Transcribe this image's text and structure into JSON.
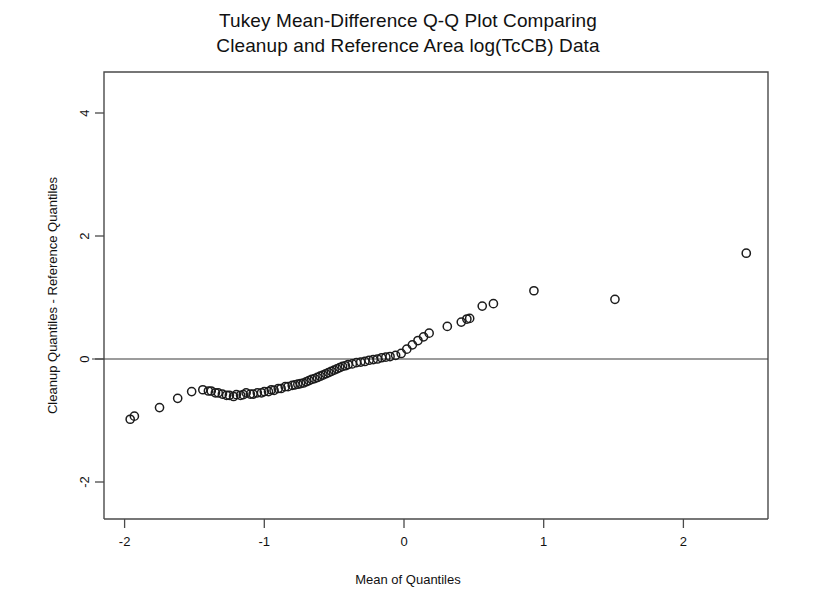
{
  "chart_data": {
    "type": "scatter",
    "title": "Tukey Mean-Difference Q-Q Plot Comparing Cleanup and Reference Area log(TcCB) Data",
    "title_lines": [
      "Tukey Mean-Difference Q-Q Plot Comparing",
      "Cleanup and Reference Area log(TcCB) Data"
    ],
    "xlabel": "Mean of Quantiles",
    "ylabel": "Cleanup Quantiles - Reference Quantiles",
    "xlim": [
      -2.15,
      2.6
    ],
    "ylim": [
      -2.7,
      4.7
    ],
    "xticks": [
      -2,
      -1,
      0,
      1,
      2
    ],
    "xticklabels": [
      "-2",
      "-1",
      "0",
      "1",
      "2"
    ],
    "yticks": [
      -2,
      0,
      2,
      4
    ],
    "yticklabels": [
      "-2",
      "0",
      "2",
      "4"
    ],
    "grid": false,
    "legend": null,
    "marker": "open-circle",
    "marker_color": "#1c1c1c",
    "reference_line": {
      "type": "horizontal",
      "y": 0,
      "color": "#3a3a3a"
    },
    "n_points": 77,
    "x": [
      -1.96,
      -1.93,
      -1.75,
      -1.62,
      -1.52,
      -1.44,
      -1.4,
      -1.38,
      -1.35,
      -1.33,
      -1.3,
      -1.27,
      -1.25,
      -1.22,
      -1.2,
      -1.17,
      -1.15,
      -1.13,
      -1.1,
      -1.08,
      -1.05,
      -1.02,
      -1.0,
      -0.97,
      -0.95,
      -0.93,
      -0.9,
      -0.88,
      -0.85,
      -0.83,
      -0.8,
      -0.78,
      -0.76,
      -0.74,
      -0.72,
      -0.7,
      -0.68,
      -0.66,
      -0.64,
      -0.62,
      -0.6,
      -0.58,
      -0.56,
      -0.54,
      -0.52,
      -0.5,
      -0.48,
      -0.46,
      -0.44,
      -0.42,
      -0.4,
      -0.37,
      -0.34,
      -0.31,
      -0.28,
      -0.25,
      -0.22,
      -0.19,
      -0.16,
      -0.13,
      -0.1,
      -0.06,
      -0.02,
      0.02,
      0.06,
      0.1,
      0.14,
      0.18,
      0.31,
      0.41,
      0.45,
      0.47,
      0.56,
      0.64,
      0.93,
      1.51,
      2.45
    ],
    "y": [
      -0.98,
      -0.93,
      -0.79,
      -0.64,
      -0.53,
      -0.5,
      -0.52,
      -0.52,
      -0.55,
      -0.55,
      -0.57,
      -0.59,
      -0.59,
      -0.61,
      -0.58,
      -0.59,
      -0.58,
      -0.55,
      -0.57,
      -0.57,
      -0.55,
      -0.55,
      -0.53,
      -0.53,
      -0.5,
      -0.51,
      -0.48,
      -0.48,
      -0.45,
      -0.45,
      -0.43,
      -0.42,
      -0.41,
      -0.4,
      -0.39,
      -0.37,
      -0.35,
      -0.33,
      -0.32,
      -0.3,
      -0.28,
      -0.26,
      -0.24,
      -0.22,
      -0.2,
      -0.18,
      -0.16,
      -0.14,
      -0.12,
      -0.11,
      -0.09,
      -0.08,
      -0.06,
      -0.05,
      -0.04,
      -0.02,
      -0.01,
      0.0,
      0.02,
      0.03,
      0.04,
      0.06,
      0.09,
      0.16,
      0.23,
      0.3,
      0.36,
      0.42,
      0.53,
      0.6,
      0.65,
      0.66,
      0.86,
      0.9,
      1.11,
      0.97,
      1.72
    ],
    "points": [
      {
        "x": -1.96,
        "y": -0.98
      },
      {
        "x": -1.93,
        "y": -0.93
      },
      {
        "x": -1.75,
        "y": -0.79
      },
      {
        "x": -1.62,
        "y": -0.64
      },
      {
        "x": -1.52,
        "y": -0.53
      },
      {
        "x": -1.44,
        "y": -0.5
      },
      {
        "x": -1.4,
        "y": -0.52
      },
      {
        "x": -1.38,
        "y": -0.52
      },
      {
        "x": -1.35,
        "y": -0.55
      },
      {
        "x": -1.33,
        "y": -0.55
      },
      {
        "x": -1.3,
        "y": -0.57
      },
      {
        "x": -1.27,
        "y": -0.59
      },
      {
        "x": -1.25,
        "y": -0.59
      },
      {
        "x": -1.22,
        "y": -0.61
      },
      {
        "x": -1.2,
        "y": -0.58
      },
      {
        "x": -1.17,
        "y": -0.59
      },
      {
        "x": -1.15,
        "y": -0.58
      },
      {
        "x": -1.13,
        "y": -0.55
      },
      {
        "x": -1.1,
        "y": -0.57
      },
      {
        "x": -1.08,
        "y": -0.57
      },
      {
        "x": -1.05,
        "y": -0.55
      },
      {
        "x": -1.02,
        "y": -0.55
      },
      {
        "x": -1.0,
        "y": -0.53
      },
      {
        "x": -0.97,
        "y": -0.53
      },
      {
        "x": -0.95,
        "y": -0.5
      },
      {
        "x": -0.93,
        "y": -0.51
      },
      {
        "x": -0.9,
        "y": -0.48
      },
      {
        "x": -0.88,
        "y": -0.48
      },
      {
        "x": -0.85,
        "y": -0.45
      },
      {
        "x": -0.83,
        "y": -0.45
      },
      {
        "x": -0.8,
        "y": -0.43
      },
      {
        "x": -0.78,
        "y": -0.42
      },
      {
        "x": -0.76,
        "y": -0.41
      },
      {
        "x": -0.74,
        "y": -0.4
      },
      {
        "x": -0.72,
        "y": -0.39
      },
      {
        "x": -0.7,
        "y": -0.37
      },
      {
        "x": -0.68,
        "y": -0.35
      },
      {
        "x": -0.66,
        "y": -0.33
      },
      {
        "x": -0.64,
        "y": -0.32
      },
      {
        "x": -0.62,
        "y": -0.3
      },
      {
        "x": -0.6,
        "y": -0.28
      },
      {
        "x": -0.58,
        "y": -0.26
      },
      {
        "x": -0.56,
        "y": -0.24
      },
      {
        "x": -0.54,
        "y": -0.22
      },
      {
        "x": -0.52,
        "y": -0.2
      },
      {
        "x": -0.5,
        "y": -0.18
      },
      {
        "x": -0.48,
        "y": -0.16
      },
      {
        "x": -0.46,
        "y": -0.14
      },
      {
        "x": -0.44,
        "y": -0.12
      },
      {
        "x": -0.42,
        "y": -0.11
      },
      {
        "x": -0.4,
        "y": -0.09
      },
      {
        "x": -0.37,
        "y": -0.08
      },
      {
        "x": -0.34,
        "y": -0.06
      },
      {
        "x": -0.31,
        "y": -0.05
      },
      {
        "x": -0.28,
        "y": -0.04
      },
      {
        "x": -0.25,
        "y": -0.02
      },
      {
        "x": -0.22,
        "y": -0.01
      },
      {
        "x": -0.19,
        "y": 0.0
      },
      {
        "x": -0.16,
        "y": 0.02
      },
      {
        "x": -0.13,
        "y": 0.03
      },
      {
        "x": -0.1,
        "y": 0.04
      },
      {
        "x": -0.06,
        "y": 0.06
      },
      {
        "x": -0.02,
        "y": 0.09
      },
      {
        "x": 0.02,
        "y": 0.16
      },
      {
        "x": 0.06,
        "y": 0.23
      },
      {
        "x": 0.1,
        "y": 0.3
      },
      {
        "x": 0.14,
        "y": 0.36
      },
      {
        "x": 0.18,
        "y": 0.42
      },
      {
        "x": 0.31,
        "y": 0.53
      },
      {
        "x": 0.41,
        "y": 0.6
      },
      {
        "x": 0.45,
        "y": 0.65
      },
      {
        "x": 0.47,
        "y": 0.66
      },
      {
        "x": 0.56,
        "y": 0.86
      },
      {
        "x": 0.64,
        "y": 0.9
      },
      {
        "x": 0.93,
        "y": 1.11
      },
      {
        "x": 1.51,
        "y": 0.97
      },
      {
        "x": 2.45,
        "y": 1.72
      }
    ]
  }
}
